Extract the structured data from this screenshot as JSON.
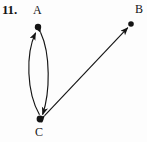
{
  "figure": {
    "problem_number": "11.",
    "type": "directed-graph",
    "background_color": "#fdfdfd",
    "ink_color": "#141414",
    "vertices": [
      {
        "id": "A",
        "label": "A",
        "x": 38,
        "y": 27,
        "label_x": 33,
        "label_y": 4,
        "radius": 3.2
      },
      {
        "id": "B",
        "label": "B",
        "x": 131,
        "y": 24,
        "label_x": 135,
        "label_y": 3,
        "radius": 2.8
      },
      {
        "id": "C",
        "label": "C",
        "x": 40,
        "y": 119,
        "label_x": 35,
        "label_y": 126,
        "radius": 3.4
      }
    ],
    "edges": [
      {
        "id": "edge-c-to-a-left",
        "from": "C",
        "to": "A",
        "style": "curved",
        "arrowheads": "at-A",
        "bow": "left"
      },
      {
        "id": "edge-a-to-c-right",
        "from": "A",
        "to": "C",
        "style": "curved",
        "arrowheads": "both",
        "bow": "right"
      },
      {
        "id": "edge-b-c",
        "from": "B",
        "to": "C",
        "style": "straight",
        "arrowheads": "both"
      }
    ]
  }
}
